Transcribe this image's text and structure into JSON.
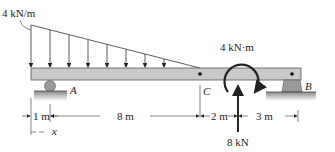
{
  "diagram": {
    "type": "beam-loading",
    "distributed_load": {
      "label": "4 kN/m",
      "shape": "triangular",
      "max_at": "left end",
      "ends_at": "C"
    },
    "moment": {
      "label": "4 kN·m",
      "direction": "clockwise"
    },
    "point_force": {
      "label": "8 kN",
      "direction": "upward"
    },
    "supports": [
      {
        "id": "A",
        "label": "A",
        "type": "roller"
      },
      {
        "id": "B",
        "label": "B",
        "type": "pin"
      }
    ],
    "points": [
      {
        "id": "C",
        "label": "C"
      }
    ],
    "dimensions": [
      {
        "label": "1 m"
      },
      {
        "label": "8 m"
      },
      {
        "label": "2 m"
      },
      {
        "label": "3 m"
      }
    ],
    "coordinate": {
      "label": "x"
    },
    "colors": {
      "beam_fill": "#c9c9c9",
      "beam_stroke": "#555555",
      "ground": "#9a9a9a",
      "line": "#222222"
    }
  }
}
